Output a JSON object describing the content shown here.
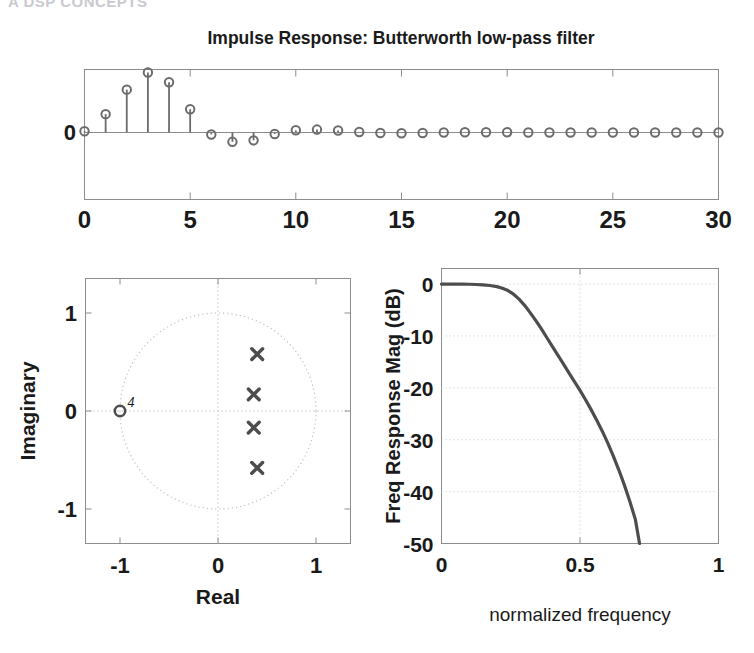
{
  "page": {
    "partial_header_text": "A DSP CONCEPTS",
    "background": "#ffffff",
    "ink": "#1a1a1a",
    "data_color": "#666666",
    "grid_color": "#cccccc"
  },
  "chart_data": [
    {
      "id": "impulse-response",
      "type": "bar",
      "subtype": "stem",
      "title": "Impulse Response: Butterworth low-pass filter",
      "xlabel": "",
      "ylabel": "",
      "xlim": [
        0,
        30
      ],
      "ylim": [
        -0.1,
        0.32
      ],
      "xticks": [
        0,
        5,
        10,
        15,
        20,
        25,
        30
      ],
      "xticklabels": [
        "0",
        "5",
        "10",
        "15",
        "20",
        "25",
        "30"
      ],
      "yticks": [
        0
      ],
      "yticklabels": [
        "0"
      ],
      "grid": false,
      "marker": "circle-open",
      "x": [
        0,
        1,
        2,
        3,
        4,
        5,
        6,
        7,
        8,
        9,
        10,
        11,
        12,
        13,
        14,
        15,
        16,
        17,
        18,
        19,
        20,
        21,
        22,
        23,
        24,
        25,
        26,
        27,
        28,
        29,
        30
      ],
      "values": [
        0.005,
        0.075,
        0.175,
        0.245,
        0.205,
        0.095,
        -0.008,
        -0.038,
        -0.032,
        -0.006,
        0.009,
        0.012,
        0.008,
        0.002,
        -0.002,
        -0.003,
        -0.002,
        0.0,
        0.001,
        0.001,
        0.001,
        0.0,
        0.0,
        0.0,
        0.0,
        0.0,
        0.0,
        0.0,
        0.0,
        0.0,
        0.0
      ]
    },
    {
      "id": "pole-zero",
      "type": "scatter",
      "subtype": "pole-zero",
      "title": "",
      "xlabel": "Real",
      "ylabel": "Imaginary",
      "xlim": [
        -1.35,
        1.35
      ],
      "ylim": [
        -1.35,
        1.35
      ],
      "xticks": [
        -1,
        0,
        1
      ],
      "xticklabels": [
        "-1",
        "0",
        "1"
      ],
      "yticks": [
        -1,
        0,
        1
      ],
      "yticklabels": [
        "1",
        "0",
        "-1"
      ],
      "grid": true,
      "unit_circle": true,
      "series": [
        {
          "name": "poles",
          "marker": "x",
          "points": [
            {
              "re": 0.4,
              "im": 0.58
            },
            {
              "re": 0.365,
              "im": 0.17
            },
            {
              "re": 0.365,
              "im": -0.17
            },
            {
              "re": 0.4,
              "im": -0.58
            }
          ]
        },
        {
          "name": "zeros",
          "marker": "o",
          "points": [
            {
              "re": -1.0,
              "im": 0.0,
              "multiplicity": "4"
            }
          ]
        }
      ]
    },
    {
      "id": "frequency-response",
      "type": "line",
      "title": "",
      "xlabel": "normalized frequency",
      "ylabel": "Freq Response Mag (dB)",
      "xlim": [
        0,
        1
      ],
      "ylim": [
        -50,
        3
      ],
      "xticks": [
        0,
        0.5,
        1
      ],
      "xticklabels": [
        "0",
        "0.5",
        "1"
      ],
      "yticks": [
        0,
        -10,
        -20,
        -30,
        -40,
        -50
      ],
      "yticklabels": [
        "0",
        "-10",
        "-20",
        "-30",
        "-40",
        "-50"
      ],
      "grid": true,
      "series": [
        {
          "name": "magnitude",
          "x": [
            0.0,
            0.025,
            0.05,
            0.075,
            0.1,
            0.125,
            0.15,
            0.175,
            0.2,
            0.22,
            0.24,
            0.26,
            0.28,
            0.3,
            0.32,
            0.34,
            0.36,
            0.38,
            0.4,
            0.42,
            0.44,
            0.46,
            0.48,
            0.5,
            0.52,
            0.54,
            0.56,
            0.58,
            0.6,
            0.62,
            0.64,
            0.66,
            0.68,
            0.7,
            0.715
          ],
          "values": [
            0.0,
            0.0,
            -0.01,
            -0.02,
            -0.04,
            -0.08,
            -0.15,
            -0.28,
            -0.5,
            -0.8,
            -1.25,
            -1.95,
            -2.9,
            -4.1,
            -5.5,
            -7.0,
            -8.6,
            -10.3,
            -12.0,
            -13.7,
            -15.4,
            -17.1,
            -18.8,
            -20.5,
            -22.3,
            -24.2,
            -26.2,
            -28.3,
            -30.6,
            -33.1,
            -35.8,
            -38.7,
            -41.9,
            -45.4,
            -50.0
          ]
        }
      ]
    }
  ],
  "titles": {
    "impulse": "Impulse Response: Butterworth low-pass filter"
  },
  "axis_labels": {
    "pz_x": "Real",
    "pz_y": "Imaginary",
    "fr_x": "normalized frequency",
    "fr_y": "Freq Response Mag (dB)"
  },
  "annotations": {
    "zero_multiplicity": "4"
  }
}
